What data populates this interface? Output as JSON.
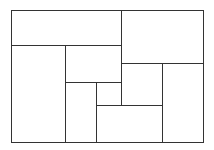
{
  "diagram": {
    "title": "",
    "type": "rectangle-partition",
    "stroke_color": "#333333",
    "stroke_width": 1,
    "background": "#ffffff",
    "outer": {
      "x": 11,
      "y": 10,
      "w": 192,
      "h": 132
    },
    "segments": [
      {
        "x1": 11,
        "y1": 45,
        "x2": 121,
        "y2": 45
      },
      {
        "x1": 121,
        "y1": 10,
        "x2": 121,
        "y2": 105
      },
      {
        "x1": 121,
        "y1": 63,
        "x2": 203,
        "y2": 63
      },
      {
        "x1": 65,
        "y1": 45,
        "x2": 65,
        "y2": 142
      },
      {
        "x1": 65,
        "y1": 82,
        "x2": 121,
        "y2": 82
      },
      {
        "x1": 96,
        "y1": 82,
        "x2": 96,
        "y2": 142
      },
      {
        "x1": 96,
        "y1": 105,
        "x2": 162,
        "y2": 105
      },
      {
        "x1": 162,
        "y1": 63,
        "x2": 162,
        "y2": 142
      }
    ],
    "region_count": 9
  }
}
